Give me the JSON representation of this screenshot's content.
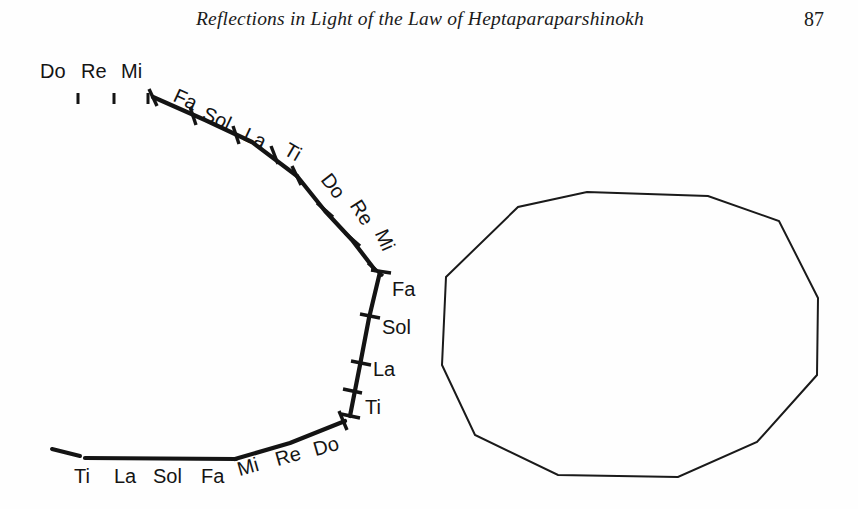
{
  "header": {
    "title": "Reflections in Light of the Law of Heptaparaparshinokh",
    "page_number": "87"
  },
  "figure": {
    "name": "octave-curve-diagram",
    "stroke_color": "#141414",
    "background_color": "#ffffff",
    "segments": {
      "top_flat": {
        "labels": [
          "Do",
          "Re",
          "Mi"
        ]
      },
      "upper_slope": {
        "labels": [
          "Fa",
          "Sol",
          "La",
          "Ti"
        ]
      },
      "mid_slope": {
        "labels": [
          "Do",
          "Re",
          "Mi"
        ]
      },
      "vertical": {
        "labels": [
          "Fa",
          "Sol",
          "La",
          "Ti"
        ]
      },
      "bottom_rise": {
        "labels": [
          "Mi",
          "Re",
          "Do"
        ]
      },
      "bottom_flat": {
        "labels": [
          "Ti",
          "La",
          "Sol",
          "Fa"
        ]
      }
    },
    "labels": {
      "top_do": "Do",
      "top_re": "Re",
      "top_mi": "Mi",
      "slope_fa": "Fa",
      "slope_sol": "Sol",
      "slope_la": "La",
      "slope_ti": "Ti",
      "mid_do": "Do",
      "mid_re": "Re",
      "mid_mi": "Mi",
      "vert_fa": "Fa",
      "vert_sol": "Sol",
      "vert_la": "La",
      "vert_ti": "Ti",
      "rise_mi": "Mi",
      "rise_re": "Re",
      "rise_do": "Do",
      "flat_ti": "Ti",
      "flat_la": "La",
      "flat_sol": "Sol",
      "flat_fa": "Fa"
    }
  },
  "polygon": {
    "name": "twelve-sided-polygon",
    "stroke_color": "#1a1a1a",
    "stroke_width": 2,
    "sides": 12,
    "vertices": [
      [
        446,
        277
      ],
      [
        518,
        207
      ],
      [
        587,
        192
      ],
      [
        708,
        196
      ],
      [
        779,
        221
      ],
      [
        818,
        298
      ],
      [
        817,
        375
      ],
      [
        757,
        442
      ],
      [
        678,
        477
      ],
      [
        558,
        475
      ],
      [
        475,
        435
      ],
      [
        442,
        365
      ]
    ]
  }
}
